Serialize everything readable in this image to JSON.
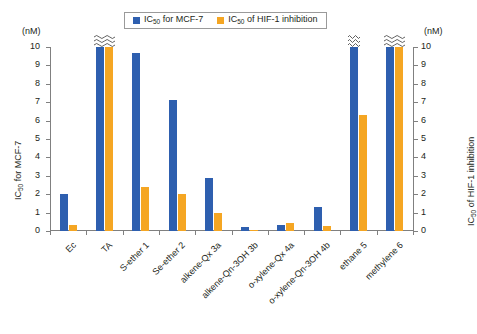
{
  "legend": {
    "position": "top-center",
    "entries": [
      {
        "name": "series-mcf7",
        "label_pre": "IC",
        "label_sub": "50",
        "label_post": " for MCF-7",
        "color": "#2e5faf"
      },
      {
        "name": "series-hif1",
        "label_pre": "IC",
        "label_sub": "50",
        "label_post": " of HIF-1 inhibition",
        "color": "#f5a623"
      }
    ]
  },
  "axes": {
    "left": {
      "unit_caption": "(nM)",
      "title_pre": "IC",
      "title_sub": "50",
      "title_post": " for MCF-7",
      "ticks": [
        "10",
        "9",
        "8",
        "7",
        "6",
        "5",
        "4",
        "3",
        "2",
        "1",
        "0"
      ],
      "min": 0,
      "max": 10
    },
    "right": {
      "unit_caption": "(nM)",
      "title_pre": "IC",
      "title_sub": "50",
      "title_post": " of HIF-1 inhibition",
      "ticks": [
        "10",
        "9",
        "8",
        "7",
        "6",
        "5",
        "4",
        "3",
        "2",
        "1",
        "0"
      ],
      "min": 0,
      "max": 10
    }
  },
  "chart_data": {
    "type": "bar",
    "title": "",
    "xlabel": "",
    "ylabel": "IC50 for MCF-7",
    "ylabel_secondary": "IC50 of HIF-1 inhibition",
    "ylim": [
      0,
      10
    ],
    "ylim_secondary": [
      0,
      10
    ],
    "grid": false,
    "legend_position": "top-center",
    "axis_break_note": "Bars drawn to 10 with a squiggle break mark represent values exceeding the axis maximum",
    "categories": [
      "Ec",
      "TA",
      "S-ether 1",
      "Se-ether 2",
      "alkene-Qx 3a",
      "alkene-Qn-3OH 3b",
      "o-xylene-Qx 4a",
      "o-xylene-Qn-3OH 4b",
      "ethane 5",
      "methylene 6"
    ],
    "series": [
      {
        "name": "IC50 for MCF-7",
        "color": "#2e5faf",
        "axis": "left",
        "values": [
          2.0,
          10.0,
          9.7,
          7.1,
          2.9,
          0.2,
          0.35,
          1.3,
          10.0,
          10.0
        ],
        "truncated": [
          false,
          true,
          false,
          false,
          false,
          false,
          false,
          false,
          true,
          true
        ]
      },
      {
        "name": "IC50 of HIF-1 inhibition",
        "color": "#f5a623",
        "axis": "right",
        "values": [
          0.35,
          10.0,
          2.4,
          2.0,
          1.0,
          0.07,
          0.45,
          0.25,
          6.3,
          10.0
        ],
        "truncated": [
          false,
          true,
          false,
          false,
          false,
          false,
          false,
          false,
          false,
          true
        ]
      }
    ]
  },
  "colors": {
    "blue": "#2e5faf",
    "orange": "#f5a623",
    "axis": "#808080",
    "text": "#231f20",
    "background": "#ffffff"
  }
}
